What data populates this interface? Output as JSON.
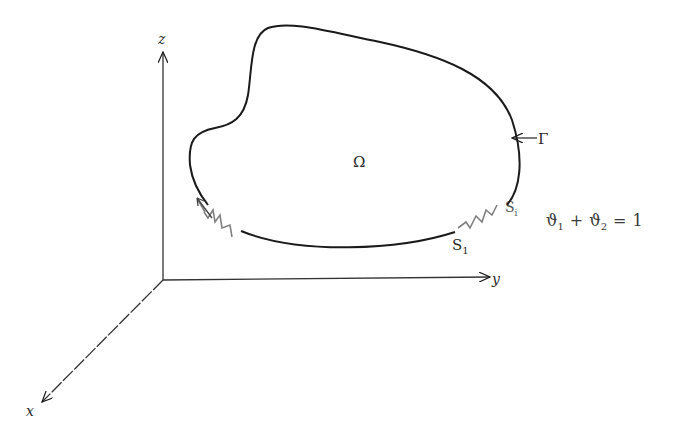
{
  "diagram": {
    "type": "domain-boundary-sketch",
    "axes": {
      "x_label": "x",
      "y_label": "y",
      "z_label": "z"
    },
    "region_label": "Ω",
    "boundary_label": "Γ",
    "segment_labels": {
      "s1": "S",
      "s1_sub": "1",
      "s2": "S",
      "s2_sub": "i"
    },
    "equation": {
      "term1": "ϑ",
      "term1_sub": "1",
      "op": "+",
      "term2": "ϑ",
      "term2_sub": "2",
      "equals": "=",
      "rhs": "1"
    },
    "colors": {
      "line": "#1a1a1a",
      "background": "#ffffff"
    }
  }
}
